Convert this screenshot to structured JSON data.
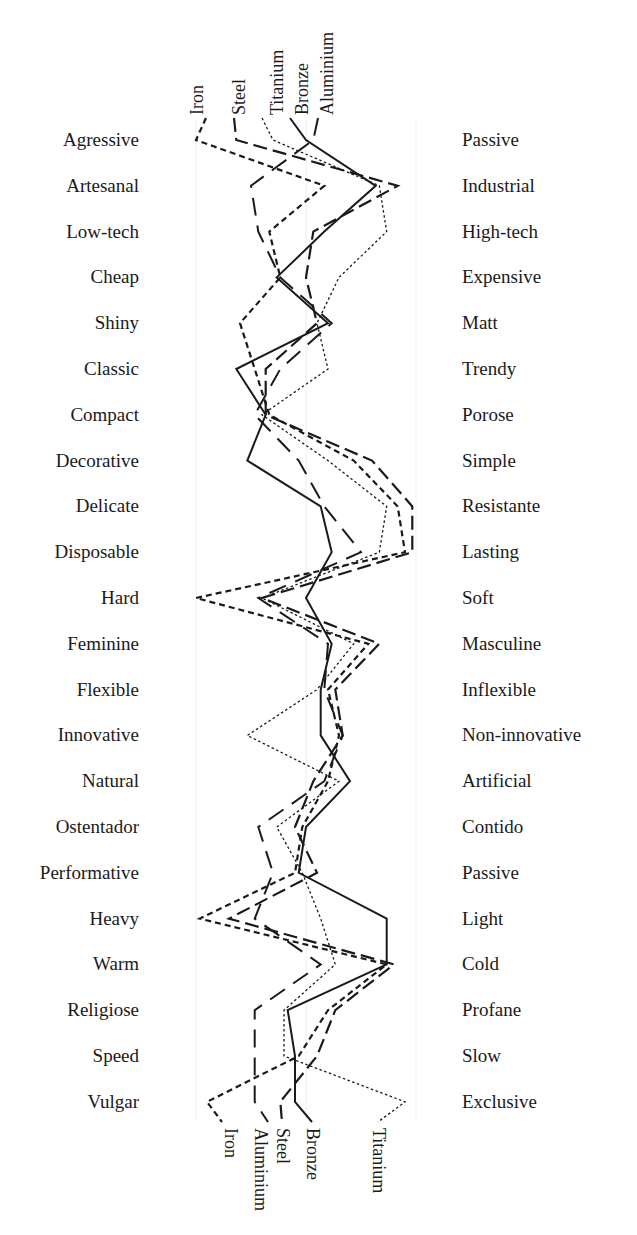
{
  "chart_data": {
    "type": "line",
    "title": "",
    "orientation": "vertical semantic differential profile",
    "xlabel": "",
    "ylabel": "",
    "scale": {
      "min": 1,
      "max": 7,
      "note": "1 = left adjective, 7 = right adjective"
    },
    "grid": true,
    "legend_position": "line-end labels (top and bottom)",
    "left_labels": [
      "Agressive",
      "Artesanal",
      "Low-tech",
      "Cheap",
      "Shiny",
      "Classic",
      "Compact",
      "Decorative",
      "Delicate",
      "Disposable",
      "Hard",
      "Feminine",
      "Flexible",
      "Innovative",
      "Natural",
      "Ostentador",
      "Performative",
      "Heavy",
      "Warm",
      "Religiose",
      "Speed",
      "Vulgar"
    ],
    "right_labels": [
      "Passive",
      "Industrial",
      "High-tech",
      "Expensive",
      "Matt",
      "Trendy",
      "Porose",
      "Simple",
      "Resistante",
      "Lasting",
      "Soft",
      "Masculine",
      "Inflexible",
      "Non-innovative",
      "Artificial",
      "Contido",
      "Passive",
      "Light",
      "Cold",
      "Profane",
      "Slow",
      "Exclusive"
    ],
    "top_labels": [
      "Iron",
      "Steel",
      "Titanium",
      "Bronze",
      "Aluminium"
    ],
    "bottom_labels": [
      "Iron",
      "Aluminium",
      "Steel",
      "Bronze",
      "Titanium"
    ],
    "series": [
      {
        "name": "Iron",
        "style": "short-dash",
        "values": [
          1.0,
          4.5,
          3.0,
          3.3,
          2.2,
          2.6,
          3.0,
          5.3,
          6.5,
          6.7,
          1.0,
          5.7,
          4.6,
          4.9,
          4.6,
          3.9,
          3.7,
          1.1,
          6.2,
          4.6,
          3.8,
          1.3
        ]
      },
      {
        "name": "Steel",
        "style": "long-dash",
        "values": [
          2.1,
          6.5,
          4.2,
          4.0,
          4.3,
          2.9,
          2.9,
          5.8,
          6.9,
          6.9,
          2.8,
          6.0,
          4.8,
          5.0,
          4.2,
          3.7,
          4.3,
          1.9,
          6.4,
          4.8,
          4.3,
          3.3
        ]
      },
      {
        "name": "Titanium",
        "style": "dotted",
        "values": [
          3.1,
          6.0,
          6.2,
          4.9,
          4.3,
          4.6,
          2.8,
          4.6,
          6.2,
          6.0,
          2.8,
          5.3,
          4.3,
          2.4,
          4.9,
          3.2,
          3.9,
          4.4,
          4.8,
          3.4,
          3.4,
          6.7
        ]
      },
      {
        "name": "Bronze",
        "style": "solid",
        "values": [
          4.0,
          5.9,
          4.5,
          3.2,
          4.6,
          2.1,
          2.9,
          2.4,
          4.4,
          4.7,
          4.0,
          4.7,
          4.4,
          4.4,
          5.2,
          4.0,
          3.8,
          6.2,
          6.2,
          3.5,
          3.7,
          3.7
        ]
      },
      {
        "name": "Aluminium",
        "style": "dash-gap",
        "values": [
          4.2,
          2.5,
          2.7,
          3.3,
          4.7,
          3.3,
          2.6,
          3.8,
          4.5,
          5.5,
          2.7,
          4.6,
          4.5,
          5.0,
          4.5,
          2.7,
          3.1,
          2.6,
          4.4,
          2.6,
          2.6,
          2.6
        ]
      }
    ]
  }
}
